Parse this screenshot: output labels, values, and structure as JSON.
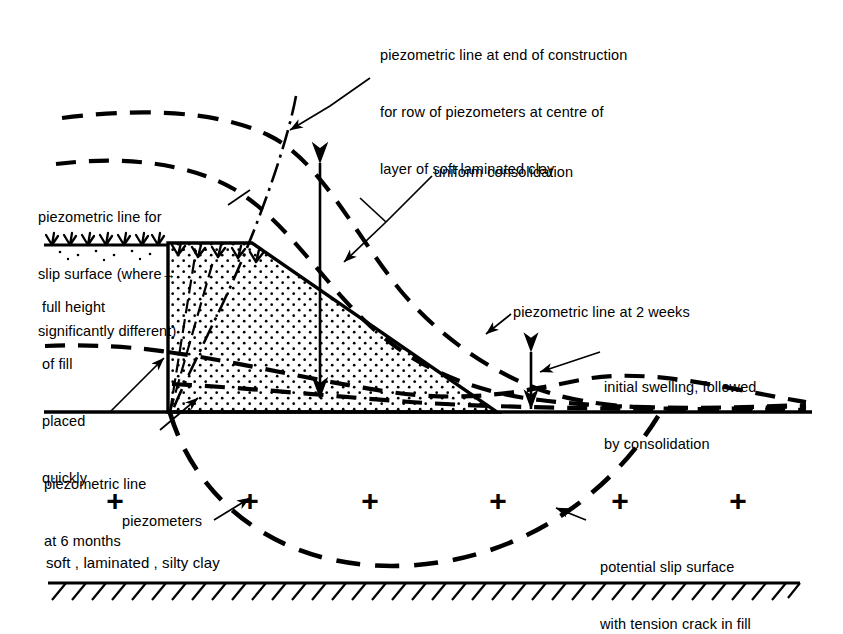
{
  "figure": {
    "kind": "geotechnical-cross-section",
    "colors": {
      "ink": "#000000",
      "paper": "#ffffff",
      "fill_stipple": "#000000"
    }
  },
  "annotations": {
    "end_of_construction": {
      "name": "piezometric-line-end-of-construction",
      "lines": [
        "piezometric line at end of construction",
        "for row of piezometers at centre of",
        "layer of soft laminated clay"
      ]
    },
    "slip_surface_line": {
      "name": "piezometric-line-for-slip-surface",
      "lines": [
        "piezometric line for",
        "slip surface (where",
        "significantly different)"
      ],
      "inline_arrow": "→"
    },
    "uniform_consolidation": {
      "name": "uniform-consolidation",
      "text": "uniform consolidation"
    },
    "full_height_fill": {
      "name": "full-height-of-fill-placed-quickly",
      "lines": [
        "full height",
        "of fill",
        "placed",
        "quickly"
      ]
    },
    "two_weeks": {
      "name": "piezometric-line-at-2-weeks",
      "text": "piezometric line at 2 weeks"
    },
    "initial_swelling": {
      "name": "initial-swelling-followed-by-consolidation",
      "lines": [
        "initial swelling, followed",
        "by consolidation"
      ]
    },
    "six_months": {
      "name": "piezometric-line-at-6-months",
      "lines": [
        "piezometric line",
        "at 6 months"
      ]
    },
    "piezometers": {
      "name": "piezometers",
      "text": "piezometers"
    },
    "slip_surface": {
      "name": "potential-slip-surface",
      "lines": [
        "potential slip surface",
        "with tension crack in fill"
      ]
    },
    "soil_caption": {
      "name": "soil-description",
      "text": "soft , laminated , silty clay"
    }
  },
  "markers": {
    "piezometer_symbol": "+",
    "piezometer_count": 6,
    "piezometer_positions": [
      {
        "x": 115,
        "y": 500
      },
      {
        "x": 250,
        "y": 500
      },
      {
        "x": 370,
        "y": 500
      },
      {
        "x": 498,
        "y": 500
      },
      {
        "x": 620,
        "y": 500
      },
      {
        "x": 738,
        "y": 500
      }
    ]
  },
  "geometry": {
    "ground_line_y": 412,
    "original_ground_left_y": 245,
    "bedrock_line_y": 583,
    "embankment": {
      "crest_left_x": 168,
      "crest_right_x": 252,
      "crest_y": 243,
      "toe_x": 497,
      "base_y": 412,
      "tension_crack_x": 168
    }
  }
}
